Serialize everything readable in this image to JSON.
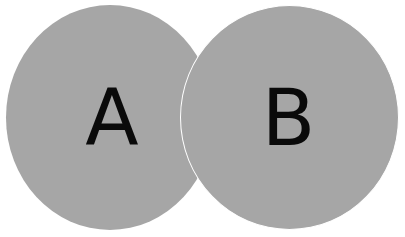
{
  "diagram": {
    "type": "two-set overlapping circles",
    "sets": [
      {
        "id": "A",
        "label": "A",
        "fill": "#a6a6a6",
        "text_color": "#0a0a0a"
      },
      {
        "id": "B",
        "label": "B",
        "fill": "#a6a6a6",
        "text_color": "#0a0a0a"
      }
    ],
    "separator_color": "#ffffff",
    "background": "#ffffff"
  }
}
